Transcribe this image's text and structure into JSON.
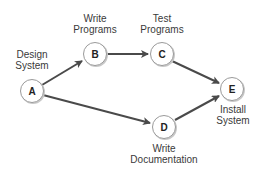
{
  "diagram": {
    "type": "activity-network",
    "colors": {
      "edge": "#4a4a4a",
      "node_fill": "#ffffff",
      "node_stroke": "#9a9a9a",
      "shadow": "#c8c8c8",
      "text": "#3a3a3a"
    },
    "nodes": [
      {
        "id": "A",
        "letter": "A",
        "label_line1": "Design",
        "label_line2": "System"
      },
      {
        "id": "B",
        "letter": "B",
        "label_line1": "Write",
        "label_line2": "Programs"
      },
      {
        "id": "C",
        "letter": "C",
        "label_line1": "Test",
        "label_line2": "Programs"
      },
      {
        "id": "D",
        "letter": "D",
        "label_line1": "Write",
        "label_line2": "Documentation"
      },
      {
        "id": "E",
        "letter": "E",
        "label_line1": "Install",
        "label_line2": "System"
      }
    ],
    "edges": [
      {
        "from": "A",
        "to": "B"
      },
      {
        "from": "B",
        "to": "C"
      },
      {
        "from": "C",
        "to": "E"
      },
      {
        "from": "A",
        "to": "D"
      },
      {
        "from": "D",
        "to": "E"
      }
    ]
  }
}
